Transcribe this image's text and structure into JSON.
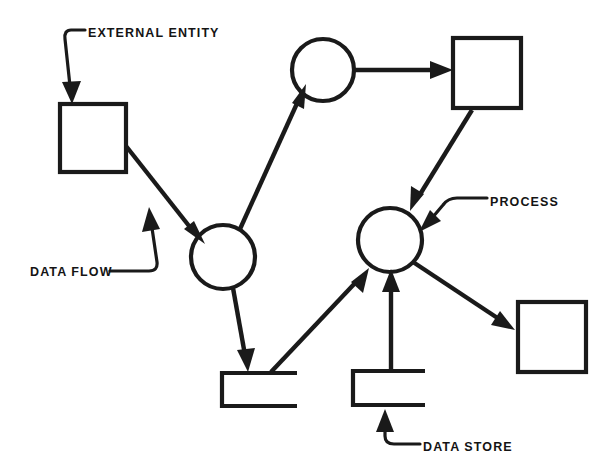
{
  "diagram": {
    "type": "data-flow-diagram",
    "background_color": "#ffffff",
    "stroke_color": "#1a1a1a",
    "callouts": [
      {
        "id": "external-entity",
        "label": "EXTERNAL ENTITY",
        "text_x": 88,
        "text_y": 37,
        "points_to": "external-entity-box"
      },
      {
        "id": "data-flow",
        "label": "DATA FLOW",
        "text_x": 30,
        "text_y": 276,
        "points_to": "flow-entity-to-process1"
      },
      {
        "id": "process",
        "label": "PROCESS",
        "text_x": 490,
        "text_y": 206,
        "points_to": "process-2"
      },
      {
        "id": "data-store",
        "label": "DATA STORE",
        "text_x": 423,
        "text_y": 451,
        "points_to": "data-store-right"
      }
    ],
    "nodes": [
      {
        "id": "external-entity-box",
        "kind": "external-entity",
        "x": 60,
        "y": 104,
        "width": 66,
        "height": 68
      },
      {
        "id": "process-top",
        "kind": "process",
        "cx": 323,
        "cy": 70,
        "r": 31
      },
      {
        "id": "entity-top-right",
        "kind": "external-entity",
        "x": 453,
        "y": 38,
        "width": 68,
        "height": 70
      },
      {
        "id": "process-1",
        "kind": "process",
        "cx": 223,
        "cy": 257,
        "r": 32
      },
      {
        "id": "process-2",
        "kind": "process",
        "cx": 390,
        "cy": 240,
        "r": 32
      },
      {
        "id": "entity-bottom-right",
        "kind": "external-entity",
        "x": 518,
        "y": 302,
        "width": 68,
        "height": 70
      },
      {
        "id": "data-store-left",
        "kind": "data-store",
        "x": 222,
        "y": 373,
        "width": 75,
        "height": 33
      },
      {
        "id": "data-store-right",
        "kind": "data-store",
        "x": 353,
        "y": 371,
        "width": 72,
        "height": 34
      }
    ],
    "flows": [
      {
        "id": "flow-entity-to-process1",
        "from": "external-entity-box",
        "to": "process-1"
      },
      {
        "id": "flow-process1-to-processtop",
        "from": "process-1",
        "to": "process-top"
      },
      {
        "id": "flow-processtop-to-entitytr",
        "from": "process-top",
        "to": "entity-top-right"
      },
      {
        "id": "flow-entitytr-to-process2",
        "from": "entity-top-right",
        "to": "process-2"
      },
      {
        "id": "flow-process1-to-storeleft",
        "from": "process-1",
        "to": "data-store-left"
      },
      {
        "id": "flow-storeleft-to-process2",
        "from": "data-store-left",
        "to": "process-2"
      },
      {
        "id": "flow-storeright-to-process2",
        "from": "data-store-right",
        "to": "process-2"
      },
      {
        "id": "flow-process2-to-entitybr",
        "from": "process-2",
        "to": "entity-bottom-right"
      }
    ]
  }
}
